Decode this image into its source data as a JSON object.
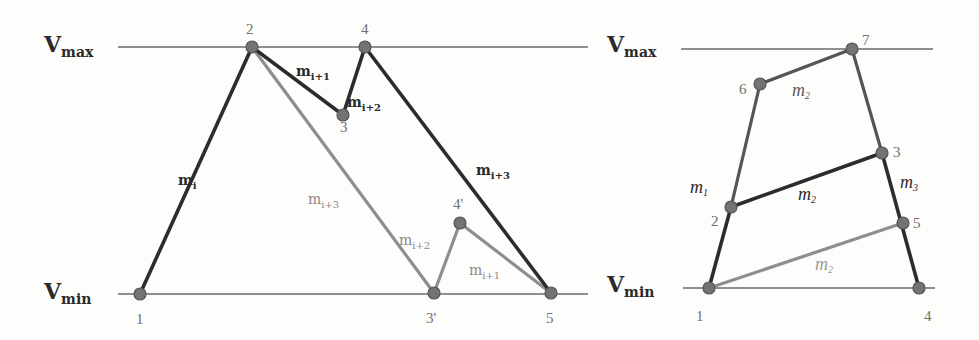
{
  "figure": {
    "left_diagram": {
      "axis_labels": {
        "vmax": {
          "main": "V",
          "sub": "max"
        },
        "vmin": {
          "main": "V",
          "sub": "min"
        }
      },
      "nodes": [
        {
          "id": "1",
          "label": "1",
          "x": 140,
          "y": 294
        },
        {
          "id": "2",
          "label": "2",
          "x": 252,
          "y": 47
        },
        {
          "id": "3",
          "label": "3",
          "x": 343,
          "y": 115
        },
        {
          "id": "4",
          "label": "4",
          "x": 365,
          "y": 47
        },
        {
          "id": "3p",
          "label": "3'",
          "x": 434,
          "y": 293
        },
        {
          "id": "4p",
          "label": "4'",
          "x": 460,
          "y": 223
        },
        {
          "id": "5",
          "label": "5",
          "x": 551,
          "y": 293
        }
      ],
      "edges_original": [
        {
          "from": "1",
          "to": "2",
          "label": {
            "main": "m",
            "sub": "i"
          }
        },
        {
          "from": "2",
          "to": "3",
          "label": {
            "main": "m",
            "sub": "i+1"
          }
        },
        {
          "from": "3",
          "to": "4",
          "label": {
            "main": "m",
            "sub": "i+2"
          }
        },
        {
          "from": "4",
          "to": "5",
          "label": {
            "main": "m",
            "sub": "i+3"
          }
        }
      ],
      "edges_reordered": [
        {
          "from": "2",
          "to": "3p",
          "label": {
            "main": "m",
            "sub": "i+3"
          }
        },
        {
          "from": "3p",
          "to": "4p",
          "label": {
            "main": "m",
            "sub": "i+2"
          }
        },
        {
          "from": "4p",
          "to": "5",
          "label": {
            "main": "m",
            "sub": "i+1"
          }
        }
      ]
    },
    "right_diagram": {
      "axis_labels": {
        "vmax": {
          "main": "V",
          "sub": "max"
        },
        "vmin": {
          "main": "V",
          "sub": "min"
        }
      },
      "nodes": [
        {
          "id": "1",
          "label": "1",
          "x": 709,
          "y": 288
        },
        {
          "id": "2",
          "label": "2",
          "x": 731,
          "y": 207
        },
        {
          "id": "3",
          "label": "3",
          "x": 882,
          "y": 153
        },
        {
          "id": "4",
          "label": "4",
          "x": 919,
          "y": 288
        },
        {
          "id": "5",
          "label": "5",
          "x": 903,
          "y": 223
        },
        {
          "id": "6",
          "label": "6",
          "x": 760,
          "y": 84
        },
        {
          "id": "7",
          "label": "7",
          "x": 852,
          "y": 49
        }
      ],
      "edge_labels": {
        "m1": {
          "main": "m",
          "sub": "1"
        },
        "m2_top": {
          "main": "m",
          "sub": "2"
        },
        "m2_mid": {
          "main": "m",
          "sub": "2"
        },
        "m2_bottom": {
          "main": "m",
          "sub": "2"
        },
        "m3": {
          "main": "m",
          "sub": "3"
        }
      }
    },
    "colors": {
      "dark_edge": "#2c2c2c",
      "mid_edge": "#555555",
      "light_edge": "#8e8e8e",
      "node_fill": "#737373",
      "axis_line": "#6a6a6a"
    }
  }
}
